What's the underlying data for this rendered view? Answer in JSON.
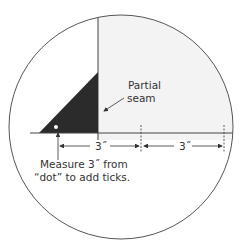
{
  "diagram": {
    "partial_seam_label": [
      "Partial",
      "seam"
    ],
    "measure_label_lines": [
      "Measure 3˝ from",
      "“dot” to add ticks."
    ],
    "dimension_labels": [
      "3˝",
      "3˝"
    ],
    "colors": {
      "triangle": "#2b2b2b",
      "fabric": "#f3f3f3",
      "outline": "#555555",
      "text": "#333333"
    }
  }
}
